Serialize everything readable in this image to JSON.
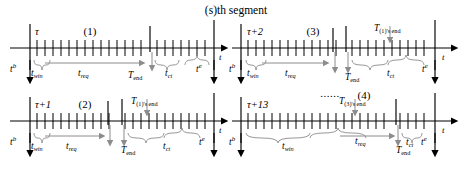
{
  "figure": {
    "title": "(s)th segment",
    "axis_label": "t",
    "ellipsis": "......"
  },
  "labels": {
    "t_begin": "t",
    "t_begin_sup": "b",
    "t_end_bound": "t",
    "t_end_bound_sup": "e",
    "t_win": "t",
    "t_win_sub": "win",
    "t_req": "t",
    "t_req_sub": "req",
    "t_ct": "t",
    "t_ct_sub": "ct",
    "T_end": "T",
    "T_end_sub": "end",
    "T1_end": "T",
    "T1_end_sub": "(1)'s end",
    "T3_end": "T",
    "T3_end_sub": "(3)'s end"
  },
  "panels": [
    {
      "id": "panel-1",
      "index_label": "(1)",
      "start_label": "τ",
      "marker_label": null,
      "ellipsis": false
    },
    {
      "id": "panel-3",
      "index_label": "(3)",
      "start_label": "τ+2",
      "marker_label": "T_(1)'s end",
      "ellipsis": false
    },
    {
      "id": "panel-2",
      "index_label": "(2)",
      "start_label": "τ+1",
      "marker_label": "T_(1)'s end",
      "ellipsis": false
    },
    {
      "id": "panel-4",
      "index_label": "(4)",
      "start_label": "τ+13",
      "marker_label": "T_(3)'s end",
      "ellipsis": true
    }
  ],
  "colors": {
    "ink": "#000000",
    "gray": "#8c8c8c",
    "background": "#ffffff"
  }
}
